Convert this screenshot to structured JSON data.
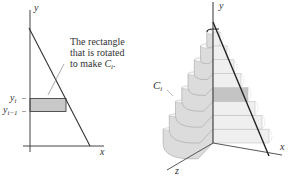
{
  "figure": {
    "left_panel": {
      "axis_x_label": "x",
      "axis_y_label": "y",
      "tick_yi": "y",
      "tick_yi_sub": "i",
      "tick_yi1": "y",
      "tick_yi1_sub": "i−1",
      "annotation_line1": "The rectangle",
      "annotation_line2": "that is rotated",
      "annotation_line3_prefix": "to make ",
      "annotation_line3_var": "C",
      "annotation_line3_sub": "i",
      "annotation_line3_suffix": ".",
      "rectangle_color": "#c8c8c8"
    },
    "right_panel": {
      "axis_x_label": "x",
      "axis_y_label": "y",
      "axis_z_label": "z",
      "disk_label": "C",
      "disk_label_sub": "i",
      "disk_count": 8,
      "highlighted_disk_index": 3,
      "disk_face_color": "#efefef",
      "disk_side_color": "#dcdcdc",
      "highlight_color": "#c4c4c4"
    }
  }
}
